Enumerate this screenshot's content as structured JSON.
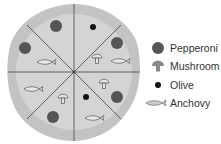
{
  "diagram": {
    "title": "",
    "pizza": {
      "slices": 8,
      "slice_toppings": [
        [
          "olive"
        ],
        [
          "pepperoni",
          "mushroom",
          "anchovy"
        ],
        [
          "mushroom",
          "pepperoni"
        ],
        [
          "olive",
          "anchovy"
        ],
        [
          "mushroom",
          "pepperoni"
        ],
        [
          "anchovy"
        ],
        [
          "pepperoni",
          "anchovy"
        ],
        [
          "pepperoni"
        ]
      ]
    },
    "legend": [
      {
        "key": "pepperoni",
        "label": "Pepperoni",
        "icon": "pepperoni-icon"
      },
      {
        "key": "mushroom",
        "label": "Mushroom",
        "icon": "mushroom-icon"
      },
      {
        "key": "olive",
        "label": "Olive",
        "icon": "olive-icon"
      },
      {
        "key": "anchovy",
        "label": "Anchovy",
        "icon": "anchovy-icon"
      }
    ],
    "colors": {
      "crust": "#c4c4c4",
      "cheese": "#d3d3d3",
      "pepperoni": "#555555",
      "olive": "#111111",
      "lines": "#444444"
    }
  }
}
